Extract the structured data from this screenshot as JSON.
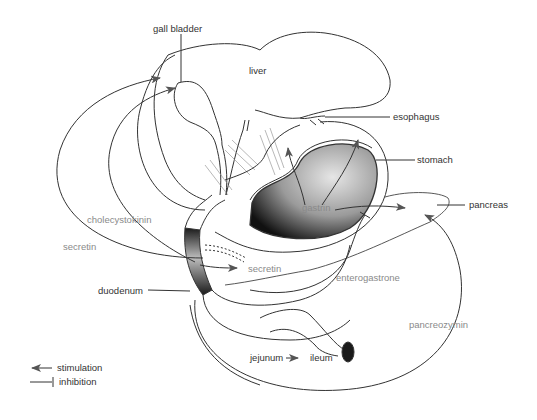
{
  "diagram": {
    "type": "anatomical-hormone-diagram",
    "organs": [
      {
        "id": "gall_bladder",
        "label": "gall bladder"
      },
      {
        "id": "liver",
        "label": "liver"
      },
      {
        "id": "esophagus",
        "label": "esophagus"
      },
      {
        "id": "stomach",
        "label": "stomach"
      },
      {
        "id": "pancreas",
        "label": "pancreas"
      },
      {
        "id": "duodenum",
        "label": "duodenum"
      },
      {
        "id": "jejunum",
        "label": "jejunum"
      },
      {
        "id": "ileum",
        "label": "ileum"
      }
    ],
    "hormones": [
      {
        "id": "gastrin",
        "label": "gastrin"
      },
      {
        "id": "cholecystokinin",
        "label": "cholecystokinin"
      },
      {
        "id": "secretin_left",
        "label": "secretin"
      },
      {
        "id": "secretin_center",
        "label": "secretin"
      },
      {
        "id": "enterogastrone",
        "label": "enterogastrone"
      },
      {
        "id": "pancreozymin",
        "label": "pancreozymin"
      }
    ],
    "jejunum_ileum_arrow": "→",
    "legend": {
      "stimulation": "stimulation",
      "inhibition": "inhibition"
    },
    "colors": {
      "line": "#333333",
      "hormone_text": "#8a8a8a",
      "organ_text": "#333333",
      "lumen_fill": "#1a1a1a"
    }
  }
}
